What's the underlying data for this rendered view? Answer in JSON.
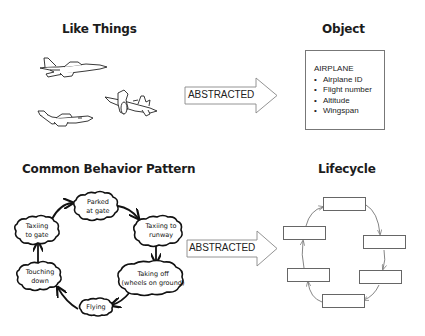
{
  "panels": {
    "like_things": {
      "title": "Like Things",
      "items": [
        {
          "icon": "jet-airplane-icon"
        },
        {
          "icon": "business-jet-airplane-icon"
        },
        {
          "icon": "propeller-airplane-icon"
        }
      ]
    },
    "object": {
      "title": "Object",
      "class_name": "AIRPLANE",
      "attributes": [
        "Airplane ID",
        "Flight number",
        "Altitude",
        "Wingspan"
      ]
    },
    "common_behavior_pattern": {
      "title": "Common Behavior Pattern",
      "states": [
        {
          "line1": "Parked",
          "line2": "at gate"
        },
        {
          "line1": "Taxiing to",
          "line2": "runway"
        },
        {
          "line1": "Taking off",
          "line2": "(wheels on ground)"
        },
        {
          "line1": "Flying",
          "line2": ""
        },
        {
          "line1": "Touching",
          "line2": "down"
        },
        {
          "line1": "Taxiing",
          "line2": "to gate"
        }
      ]
    },
    "lifecycle": {
      "title": "Lifecycle",
      "box_count": 6
    }
  },
  "arrows": {
    "top": {
      "label": "ABSTRACTED"
    },
    "bottom": {
      "label": "ABSTRACTED"
    }
  }
}
